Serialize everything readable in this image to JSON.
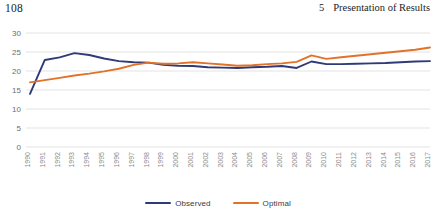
{
  "header": {
    "folio": "108",
    "chapter_number": "5",
    "chapter_title": "Presentation of Results"
  },
  "legend": {
    "items": [
      {
        "label": "Observed",
        "color": "#2e3b76"
      },
      {
        "label": "Optimal",
        "color": "#e2722a"
      }
    ]
  },
  "chart_data": {
    "type": "line",
    "title": "",
    "subtitle": "",
    "xlabel": "",
    "ylabel": "",
    "grid": true,
    "legend_position": "bottom",
    "xlim": [
      1990,
      2017
    ],
    "ylim": [
      0,
      30
    ],
    "yticks": [
      0,
      5,
      10,
      15,
      20,
      25,
      30
    ],
    "ytick_labels": [
      "0",
      "5",
      "10",
      "15",
      "20",
      "25",
      "30"
    ],
    "categories": [
      "1990",
      "1991",
      "1992",
      "1993",
      "1994",
      "1995",
      "1996",
      "1997",
      "1998",
      "1999",
      "2000",
      "2001",
      "2002",
      "2003",
      "2004",
      "2005",
      "2006",
      "2007",
      "2008",
      "2009",
      "2010",
      "2011",
      "2012",
      "2013",
      "2014",
      "2015",
      "2016",
      "2017"
    ],
    "series": [
      {
        "name": "Observed",
        "color": "#2e3b76",
        "values": [
          14.0,
          22.9,
          23.6,
          24.7,
          24.2,
          23.3,
          22.6,
          22.3,
          22.2,
          21.6,
          21.4,
          21.3,
          21.0,
          20.9,
          20.8,
          21.0,
          21.1,
          21.3,
          20.8,
          22.5,
          21.8,
          21.8,
          21.9,
          22.0,
          22.1,
          22.3,
          22.5,
          22.6
        ]
      },
      {
        "name": "Optimal",
        "color": "#e2722a",
        "values": [
          17.0,
          17.6,
          18.2,
          18.8,
          19.3,
          19.9,
          20.6,
          21.6,
          22.2,
          21.9,
          22.0,
          22.3,
          22.0,
          21.7,
          21.4,
          21.5,
          21.8,
          22.0,
          22.4,
          24.1,
          23.2,
          23.6,
          24.0,
          24.4,
          24.8,
          25.2,
          25.6,
          26.2
        ]
      }
    ]
  }
}
